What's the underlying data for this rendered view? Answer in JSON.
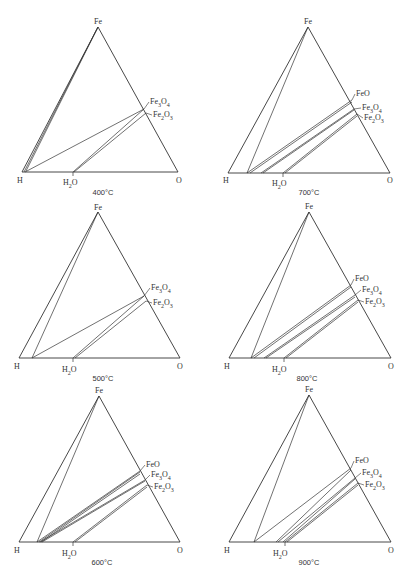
{
  "figure": {
    "vertex_labels": {
      "top": "Fe",
      "left": "H",
      "right": "O"
    },
    "water_label": {
      "base": "H",
      "sub": "2",
      "tail": "O"
    },
    "panels": [
      {
        "id": "400",
        "temperature_label": "400°C",
        "offset": [
          0,
          0
        ],
        "apex": [
          98,
          27
        ],
        "left": [
          22,
          172
        ],
        "right": [
          178,
          172
        ],
        "h2o": [
          73,
          172
        ],
        "phases": [
          {
            "name": "Fe3O4",
            "base": "Fe",
            "sub1": "3",
            "mid": "O",
            "sub2": "4",
            "point": [
              144,
              109
            ],
            "label_pos": [
              150,
              104
            ]
          },
          {
            "name": "Fe2O3",
            "base": "Fe",
            "sub1": "2",
            "mid": "O",
            "sub2": "3",
            "point": [
              146,
              113
            ],
            "label_pos": [
              153,
              117
            ]
          }
        ],
        "lines": [
          [
            [
              98,
              27
            ],
            [
              24,
              172
            ]
          ],
          [
            [
              98,
              27
            ],
            [
              26,
              171
            ]
          ],
          [
            [
              144,
              109
            ],
            [
              25,
              172
            ]
          ],
          [
            [
              144,
              109
            ],
            [
              73,
              172
            ]
          ],
          [
            [
              146,
              113
            ],
            [
              74,
              172
            ]
          ]
        ],
        "labels_pos": {
          "fe": [
            98,
            24
          ],
          "h": [
            20,
            183
          ],
          "o": [
            179,
            183
          ],
          "h2o": [
            63,
            185
          ],
          "temp": [
            103,
            195
          ]
        }
      },
      {
        "id": "700",
        "temperature_label": "700°C",
        "offset": [
          206,
          0
        ],
        "apex": [
          102,
          27
        ],
        "left": [
          22,
          173
        ],
        "right": [
          184,
          173
        ],
        "h2o": [
          77,
          173
        ],
        "phases": [
          {
            "name": "FeO",
            "base": "FeO",
            "sub1": "",
            "mid": "",
            "sub2": "",
            "point": [
              146,
              100
            ],
            "label_pos": [
              150,
              96
            ]
          },
          {
            "name": "Fe3O4",
            "base": "Fe",
            "sub1": "3",
            "mid": "O",
            "sub2": "4",
            "point": [
              148,
              109
            ],
            "label_pos": [
              156,
              110
            ]
          },
          {
            "name": "Fe2O3",
            "base": "Fe",
            "sub1": "2",
            "mid": "O",
            "sub2": "3",
            "point": [
              151,
              114
            ],
            "label_pos": [
              158,
              120
            ]
          }
        ],
        "lines": [
          [
            [
              102,
              27
            ],
            [
              41,
              173
            ]
          ],
          [
            [
              146,
              100
            ],
            [
              41,
              173
            ]
          ],
          [
            [
              146,
              102
            ],
            [
              44,
              173
            ]
          ],
          [
            [
              148,
              109
            ],
            [
              55,
              173
            ]
          ],
          [
            [
              148,
              110
            ],
            [
              57,
              173
            ]
          ],
          [
            [
              151,
              114
            ],
            [
              77,
              173
            ]
          ],
          [
            [
              151,
              116
            ],
            [
              79,
              173
            ]
          ]
        ],
        "labels_pos": {
          "fe": [
            102,
            24
          ],
          "h": [
            20,
            183
          ],
          "o": [
            184,
            183
          ],
          "h2o": [
            66,
            186
          ],
          "temp": [
            103,
            195
          ]
        }
      },
      {
        "id": "500",
        "temperature_label": "500°C",
        "offset": [
          0,
          190
        ],
        "apex": [
          98,
          22
        ],
        "left": [
          19,
          168
        ],
        "right": [
          180,
          168
        ],
        "h2o": [
          73,
          168
        ],
        "phases": [
          {
            "name": "Fe3O4",
            "base": "Fe",
            "sub1": "3",
            "mid": "O",
            "sub2": "4",
            "point": [
              144,
              106
            ],
            "label_pos": [
              151,
              100
            ]
          },
          {
            "name": "Fe2O3",
            "base": "Fe",
            "sub1": "2",
            "mid": "O",
            "sub2": "3",
            "point": [
              146,
              111
            ],
            "label_pos": [
              153,
              115
            ]
          }
        ],
        "lines": [
          [
            [
              98,
              22
            ],
            [
              32,
              168
            ]
          ],
          [
            [
              144,
              106
            ],
            [
              32,
              168
            ]
          ],
          [
            [
              144,
              106
            ],
            [
              73,
              168
            ]
          ],
          [
            [
              146,
              111
            ],
            [
              75,
              168
            ]
          ]
        ],
        "labels_pos": {
          "fe": [
            98,
            20
          ],
          "h": [
            17,
            179
          ],
          "o": [
            180,
            179
          ],
          "h2o": [
            62,
            182
          ],
          "temp": [
            103,
            191
          ]
        }
      },
      {
        "id": "800",
        "temperature_label": "800°C",
        "offset": [
          206,
          190
        ],
        "apex": [
          103,
          22
        ],
        "left": [
          23,
          168
        ],
        "right": [
          185,
          168
        ],
        "h2o": [
          78,
          168
        ],
        "phases": [
          {
            "name": "FeO",
            "base": "FeO",
            "sub1": "",
            "mid": "",
            "sub2": "",
            "point": [
              145,
              95
            ],
            "label_pos": [
              149,
              91
            ]
          },
          {
            "name": "Fe3O4",
            "base": "Fe",
            "sub1": "3",
            "mid": "O",
            "sub2": "4",
            "point": [
              149,
              105
            ],
            "label_pos": [
              156,
              102
            ]
          },
          {
            "name": "Fe2O3",
            "base": "Fe",
            "sub1": "2",
            "mid": "O",
            "sub2": "3",
            "point": [
              152,
              110
            ],
            "label_pos": [
              159,
              114
            ]
          }
        ],
        "lines": [
          [
            [
              103,
              22
            ],
            [
              45,
              168
            ]
          ],
          [
            [
              145,
              95
            ],
            [
              45,
              168
            ]
          ],
          [
            [
              145,
              97
            ],
            [
              48,
              168
            ]
          ],
          [
            [
              149,
              105
            ],
            [
              58,
              168
            ]
          ],
          [
            [
              149,
              107
            ],
            [
              60,
              168
            ]
          ],
          [
            [
              152,
              110
            ],
            [
              78,
              168
            ]
          ],
          [
            [
              152,
              112
            ],
            [
              80,
              168
            ]
          ]
        ],
        "labels_pos": {
          "fe": [
            103,
            19
          ],
          "h": [
            21,
            179
          ],
          "o": [
            185,
            179
          ],
          "h2o": [
            66,
            182
          ],
          "temp": [
            101,
            191
          ]
        }
      },
      {
        "id": "600",
        "temperature_label": "600°C",
        "offset": [
          0,
          385
        ],
        "apex": [
          99,
          11
        ],
        "left": [
          19,
          157
        ],
        "right": [
          180,
          157
        ],
        "h2o": [
          73,
          157
        ],
        "phases": [
          {
            "name": "FeO",
            "base": "FeO",
            "sub1": "",
            "mid": "",
            "sub2": "",
            "point": [
              140,
              86
            ],
            "label_pos": [
              146,
              82
            ]
          },
          {
            "name": "Fe3O4",
            "base": "Fe",
            "sub1": "3",
            "mid": "O",
            "sub2": "4",
            "point": [
              145,
              95
            ],
            "label_pos": [
              151,
              92
            ]
          },
          {
            "name": "Fe2O3",
            "base": "Fe",
            "sub1": "2",
            "mid": "O",
            "sub2": "3",
            "point": [
              147,
              100
            ],
            "label_pos": [
              154,
              104
            ]
          }
        ],
        "lines": [
          [
            [
              99,
              11
            ],
            [
              37,
              157
            ]
          ],
          [
            [
              140,
              86
            ],
            [
              37,
              157
            ]
          ],
          [
            [
              140,
              87
            ],
            [
              39,
              157
            ]
          ],
          [
            [
              140,
              89
            ],
            [
              41,
              157
            ]
          ],
          [
            [
              145,
              95
            ],
            [
              40,
              157
            ]
          ],
          [
            [
              145,
              96
            ],
            [
              42,
              157
            ]
          ],
          [
            [
              147,
              100
            ],
            [
              73,
              157
            ]
          ],
          [
            [
              147,
              102
            ],
            [
              75,
              157
            ]
          ]
        ],
        "labels_pos": {
          "fe": [
            99,
            8
          ],
          "h": [
            17,
            168
          ],
          "o": [
            180,
            168
          ],
          "h2o": [
            62,
            171
          ],
          "temp": [
            102,
            180
          ]
        }
      },
      {
        "id": "900",
        "temperature_label": "900°C",
        "offset": [
          206,
          385
        ],
        "apex": [
          103,
          10
        ],
        "left": [
          23,
          157
        ],
        "right": [
          185,
          157
        ],
        "h2o": [
          79,
          157
        ],
        "phases": [
          {
            "name": "FeO",
            "base": "FeO",
            "sub1": "",
            "mid": "",
            "sub2": "",
            "point": [
              145,
              83
            ],
            "label_pos": [
              149,
              78
            ]
          },
          {
            "name": "Fe3O4",
            "base": "Fe",
            "sub1": "3",
            "mid": "O",
            "sub2": "4",
            "point": [
              149,
              93
            ],
            "label_pos": [
              156,
              90
            ]
          },
          {
            "name": "Fe2O3",
            "base": "Fe",
            "sub1": "2",
            "mid": "O",
            "sub2": "3",
            "point": [
              152,
              98
            ],
            "label_pos": [
              159,
              102
            ]
          }
        ],
        "lines": [
          [
            [
              103,
              10
            ],
            [
              48,
              157
            ]
          ],
          [
            [
              145,
              83
            ],
            [
              48,
              157
            ]
          ],
          [
            [
              145,
              85
            ],
            [
              70,
              157
            ]
          ],
          [
            [
              149,
              93
            ],
            [
              72,
              157
            ]
          ],
          [
            [
              149,
              94
            ],
            [
              77,
              157
            ]
          ],
          [
            [
              152,
              98
            ],
            [
              79,
              157
            ]
          ],
          [
            [
              152,
              100
            ],
            [
              81,
              157
            ]
          ]
        ],
        "labels_pos": {
          "fe": [
            103,
            7
          ],
          "h": [
            21,
            168
          ],
          "o": [
            185,
            168
          ],
          "h2o": [
            67,
            171
          ],
          "temp": [
            103,
            180
          ]
        }
      }
    ]
  },
  "style": {
    "line_color": "#333333",
    "text_color": "#333333",
    "background": "#ffffff"
  }
}
